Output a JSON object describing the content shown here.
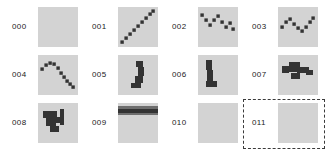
{
  "view": {
    "kind": "thumbnail-grid",
    "columns": 4,
    "rows": 3,
    "background_color": "#ffffff",
    "tile_background_color": "#d3d3d3",
    "tile_mark_color": "#333333",
    "label_color": "#1a1a1a",
    "selection_color": "#3a3a3a"
  },
  "selection": {
    "selected_index": 11,
    "selected_label": "011",
    "style": "dashed-rectangle"
  },
  "items": [
    {
      "index": 0,
      "label": "000",
      "thumbnail": "blank",
      "description": "empty plot",
      "points": []
    },
    {
      "index": 1,
      "label": "001",
      "thumbnail": "diagonal-line",
      "description": "monotonic ascending diagonal of square markers",
      "points": [
        [
          4,
          35
        ],
        [
          8,
          31
        ],
        [
          12,
          27
        ],
        [
          16,
          23
        ],
        [
          20,
          19
        ],
        [
          24,
          15
        ],
        [
          28,
          11
        ],
        [
          32,
          7
        ],
        [
          35,
          4
        ]
      ]
    },
    {
      "index": 2,
      "label": "002",
      "thumbnail": "zigzag-w",
      "description": "descending zigzag W wave",
      "points": [
        [
          4,
          8
        ],
        [
          8,
          13
        ],
        [
          12,
          18
        ],
        [
          16,
          13
        ],
        [
          20,
          9
        ],
        [
          24,
          15
        ],
        [
          28,
          20
        ],
        [
          32,
          16
        ],
        [
          35,
          22
        ]
      ]
    },
    {
      "index": 3,
      "label": "003",
      "thumbnail": "wave-m-v",
      "description": "wave rising, dipping, rising again",
      "points": [
        [
          4,
          20
        ],
        [
          8,
          15
        ],
        [
          12,
          12
        ],
        [
          16,
          17
        ],
        [
          20,
          21
        ],
        [
          24,
          24
        ],
        [
          28,
          20
        ],
        [
          32,
          15
        ],
        [
          35,
          11
        ]
      ]
    },
    {
      "index": 4,
      "label": "004",
      "thumbnail": "arch-curve",
      "description": "concave arch peaking left of centre then falling",
      "points": [
        [
          4,
          14
        ],
        [
          8,
          10
        ],
        [
          12,
          8
        ],
        [
          16,
          9
        ],
        [
          20,
          13
        ],
        [
          23,
          18
        ],
        [
          26,
          22
        ],
        [
          29,
          26
        ],
        [
          32,
          29
        ],
        [
          35,
          32
        ]
      ]
    },
    {
      "index": 5,
      "label": "005",
      "thumbnail": "blob-vertical",
      "description": "vertical dark blob with foot at lower left",
      "blocks": [
        [
          18,
          6,
          7,
          6
        ],
        [
          20,
          12,
          6,
          9
        ],
        [
          17,
          21,
          8,
          7
        ],
        [
          13,
          28,
          10,
          5
        ]
      ]
    },
    {
      "index": 6,
      "label": "006",
      "thumbnail": "blob-vertical-left",
      "description": "vertical dark bar at left with foot",
      "blocks": [
        [
          8,
          5,
          6,
          10
        ],
        [
          9,
          15,
          6,
          11
        ],
        [
          8,
          26,
          11,
          6
        ]
      ]
    },
    {
      "index": 7,
      "label": "007",
      "thumbnail": "blob-horizontal-cluster",
      "description": "horizontal dark cluster across the middle",
      "blocks": [
        [
          4,
          11,
          7,
          7
        ],
        [
          11,
          7,
          11,
          10
        ],
        [
          19,
          12,
          12,
          6
        ],
        [
          28,
          15,
          7,
          5
        ],
        [
          13,
          18,
          9,
          6
        ]
      ]
    },
    {
      "index": 8,
      "label": "008",
      "thumbnail": "blob-with-tail",
      "description": "dark blob with thin vertical tail at right",
      "blocks": [
        [
          5,
          8,
          14,
          7
        ],
        [
          8,
          15,
          10,
          8
        ],
        [
          12,
          23,
          9,
          6
        ],
        [
          22,
          6,
          4,
          16
        ],
        [
          18,
          14,
          7,
          6
        ]
      ]
    },
    {
      "index": 9,
      "label": "009",
      "thumbnail": "horizontal-bands",
      "description": "dark horizontal band near the top edge",
      "bands": [
        [
          0,
          3,
          40,
          3
        ],
        [
          0,
          6,
          40,
          4
        ],
        [
          0,
          10,
          40,
          2
        ]
      ]
    },
    {
      "index": 10,
      "label": "010",
      "thumbnail": "blank",
      "description": "empty plot",
      "points": []
    },
    {
      "index": 11,
      "label": "011",
      "thumbnail": "blank",
      "description": "empty plot, currently selected",
      "points": []
    }
  ]
}
